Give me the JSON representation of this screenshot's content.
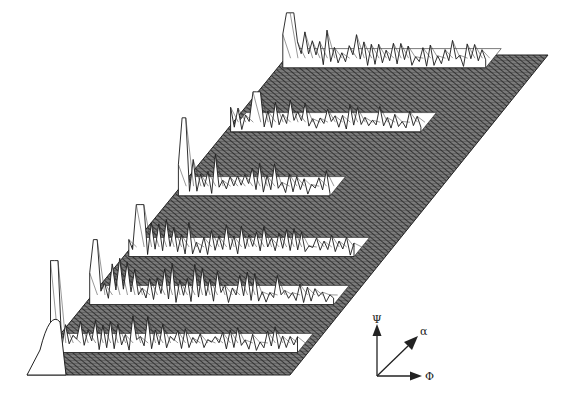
{
  "figure": {
    "background": "#ffffff",
    "base_fill": "#6a6a6a",
    "hatch_color": "#2a2a2a",
    "line_color": "#1a1a1a",
    "spike_fill": "#ffffff"
  },
  "axes_indicator": {
    "vertical_label": "Ψ",
    "diagonal_label": "α",
    "horizontal_label": "Φ"
  },
  "chart_data": {
    "type": "surface",
    "title": "",
    "axes": {
      "x": "Φ",
      "y": "α",
      "z": "Ψ"
    },
    "base_parallelogram": {
      "bottom_left": [
        27,
        375
      ],
      "bottom_right": [
        290,
        375
      ],
      "top_right": [
        548,
        55
      ],
      "top_left": [
        288,
        55
      ]
    },
    "ridges": [
      {
        "row_frac": 0.04,
        "start_frac": 0.02,
        "end_frac": 0.8,
        "max_height": 45,
        "peak_at": 0.05,
        "peak_height": 55
      },
      {
        "row_frac": 0.24,
        "start_frac": 0.02,
        "end_frac": 0.75,
        "max_height": 40,
        "peak_at": 0.12,
        "peak_height": 40
      },
      {
        "row_frac": 0.44,
        "start_frac": 0.02,
        "end_frac": 0.6,
        "max_height": 48,
        "peak_at": 0.04,
        "peak_height": 78
      },
      {
        "row_frac": 0.63,
        "start_frac": 0.02,
        "end_frac": 0.88,
        "max_height": 42,
        "peak_at": 0.06,
        "peak_height": 52
      },
      {
        "row_frac": 0.78,
        "start_frac": 0.02,
        "end_frac": 0.95,
        "max_height": 50,
        "peak_at": 0.04,
        "peak_height": 65
      },
      {
        "row_frac": 0.93,
        "start_frac": 0.02,
        "end_frac": 0.96,
        "max_height": 45,
        "peak_at": 0.03,
        "peak_height": 92
      }
    ]
  }
}
